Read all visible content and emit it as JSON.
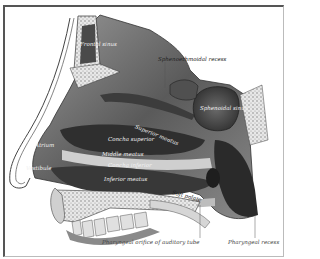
{
  "figure": {
    "colors": {
      "background": "#ffffff",
      "frame": "#555555",
      "tissue_dark": "#3a3a3a",
      "tissue_mid": "#7a7a7a",
      "tissue_light": "#c8c8c8",
      "bone": "#e6e6e6"
    },
    "labels": {
      "frontal_sinus": "Frontal sinus",
      "sphenoethmoidal_recess": "Sphenoethmoidal recess",
      "sphenoidal_sinus": "Sphenoidal sinus",
      "superior_meatus": "Superior meatus",
      "superior_concha": "Concha superior",
      "atrium": "Atrium",
      "middle_meatus": "Middle meatus",
      "concha_inferior": "Concha inferior",
      "inferior_meatus": "Inferior meatus",
      "vestibule": "Vestibule",
      "soft_palate": "Soft palate",
      "pharyngeal_orifice": "Pharyngeal orifice of auditory tube",
      "pharyngeal_recess": "Pharyngeal recess"
    }
  }
}
